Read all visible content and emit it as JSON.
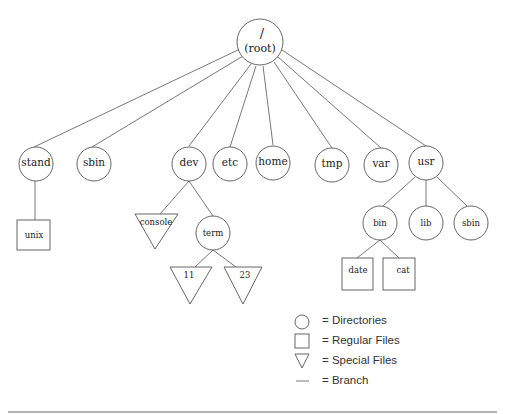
{
  "diagram": {
    "root": {
      "line1": "/",
      "line2": "(root)"
    },
    "nodes": {
      "stand": {
        "label": "stand",
        "type": "directory"
      },
      "sbin": {
        "label": "sbin",
        "type": "directory"
      },
      "dev": {
        "label": "dev",
        "type": "directory"
      },
      "etc": {
        "label": "etc",
        "type": "directory"
      },
      "home": {
        "label": "home",
        "type": "directory"
      },
      "tmp": {
        "label": "tmp",
        "type": "directory"
      },
      "var": {
        "label": "var",
        "type": "directory"
      },
      "usr": {
        "label": "usr",
        "type": "directory"
      },
      "unix": {
        "label": "unix",
        "type": "regular-file"
      },
      "console": {
        "label": "console",
        "type": "special-file"
      },
      "term": {
        "label": "term",
        "type": "directory"
      },
      "tty11": {
        "label": "11",
        "type": "special-file"
      },
      "tty23": {
        "label": "23",
        "type": "special-file"
      },
      "bin": {
        "label": "bin",
        "type": "directory"
      },
      "lib": {
        "label": "lib",
        "type": "directory"
      },
      "usr_sbin": {
        "label": "sbin",
        "type": "directory"
      },
      "date": {
        "label": "date",
        "type": "regular-file"
      },
      "cat": {
        "label": "cat",
        "type": "regular-file"
      }
    },
    "edges": [
      [
        "root",
        "stand"
      ],
      [
        "root",
        "sbin"
      ],
      [
        "root",
        "dev"
      ],
      [
        "root",
        "etc"
      ],
      [
        "root",
        "home"
      ],
      [
        "root",
        "tmp"
      ],
      [
        "root",
        "var"
      ],
      [
        "root",
        "usr"
      ],
      [
        "stand",
        "unix"
      ],
      [
        "dev",
        "console"
      ],
      [
        "dev",
        "term"
      ],
      [
        "term",
        "tty11"
      ],
      [
        "term",
        "tty23"
      ],
      [
        "usr",
        "bin"
      ],
      [
        "usr",
        "lib"
      ],
      [
        "usr",
        "usr_sbin"
      ],
      [
        "bin",
        "date"
      ],
      [
        "bin",
        "cat"
      ]
    ]
  },
  "legend": {
    "items": [
      {
        "shape": "circle-icon",
        "label": "= Directories"
      },
      {
        "shape": "square-icon",
        "label": "= Regular Files"
      },
      {
        "shape": "triangle-icon",
        "label": "= Special Files"
      },
      {
        "shape": "line-icon",
        "label": "= Branch"
      }
    ]
  }
}
